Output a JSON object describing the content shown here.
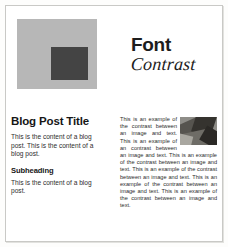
{
  "page": {
    "background_color": "#ffffff",
    "frame_color": "#c9c9c6"
  },
  "swatch": {
    "name": "color-contrast-swatch",
    "outer_color": "#b7b7b7",
    "inner_color": "#444444"
  },
  "heading": {
    "line1": "Font",
    "line2": "Contrast"
  },
  "blog": {
    "title": "Blog Post Title",
    "paragraph1": "This is the content of a blog post. This is the content of a blog post.",
    "subheading": "Subheading",
    "paragraph2": "This is the content of a blog post."
  },
  "contrast": {
    "photo_alt": "grayscale-photo",
    "paragraph": "This is an example of the contrast between an image and text. This is an example of an contrast between an image and text. This is an example of the contrast between an image and text. This is an example of the contrast between an image and text. This is an example of the contrast between an image and text. This is an example of the contrast between an image and text."
  }
}
